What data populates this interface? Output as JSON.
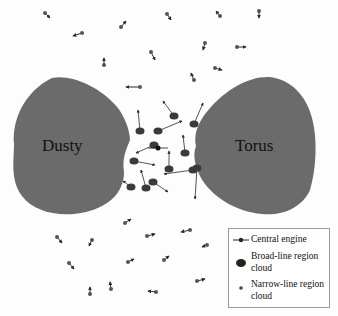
{
  "diagram": {
    "title": "",
    "labels": {
      "left_blob": "Dusty",
      "right_blob": "Torus"
    },
    "colors": {
      "torus": "#6b6b6b",
      "cloud": "#3a3a3a",
      "background": "#ffffff"
    },
    "legend": {
      "items": [
        {
          "symbol": "central-engine",
          "label": "Central engine"
        },
        {
          "symbol": "broad-line-cloud",
          "label": "Broad-line region",
          "label2": "cloud"
        },
        {
          "symbol": "narrow-line-cloud",
          "label": "Narrow-line region",
          "label2": "cloud"
        }
      ]
    },
    "central_engine": {
      "x": 158,
      "y": 148
    },
    "broad_line_clouds": [
      {
        "x": 140,
        "y": 131,
        "ax": 138,
        "ay": 110
      },
      {
        "x": 158,
        "y": 131,
        "ax": 182,
        "ay": 121
      },
      {
        "x": 174,
        "y": 116,
        "ax": 163,
        "ay": 101
      },
      {
        "x": 194,
        "y": 124,
        "ax": 203,
        "ay": 103
      },
      {
        "x": 154,
        "y": 145,
        "ax": 136,
        "ay": 153
      },
      {
        "x": 185,
        "y": 153,
        "ax": 183,
        "ay": 135
      },
      {
        "x": 134,
        "y": 161,
        "ax": 155,
        "ay": 165
      },
      {
        "x": 169,
        "y": 169,
        "ax": 169,
        "ay": 151
      },
      {
        "x": 193,
        "y": 170,
        "ax": 164,
        "ay": 174
      },
      {
        "x": 197,
        "y": 168,
        "ax": 195,
        "ay": 199
      },
      {
        "x": 153,
        "y": 182,
        "ax": 168,
        "ay": 192
      },
      {
        "x": 131,
        "y": 187,
        "ax": 123,
        "ay": 181
      },
      {
        "x": 146,
        "y": 188,
        "ax": 141,
        "ay": 170
      }
    ],
    "narrow_line_clouds": [
      {
        "x": 45,
        "y": 13,
        "ax": 50,
        "ay": 18
      },
      {
        "x": 82,
        "y": 33,
        "ax": 73,
        "ay": 36
      },
      {
        "x": 121,
        "y": 27,
        "ax": 126,
        "ay": 21
      },
      {
        "x": 167,
        "y": 14,
        "ax": 171,
        "ay": 20
      },
      {
        "x": 220,
        "y": 16,
        "ax": 216,
        "ay": 11
      },
      {
        "x": 259,
        "y": 11,
        "ax": 259,
        "ay": 18
      },
      {
        "x": 104,
        "y": 65,
        "ax": 104,
        "ay": 58
      },
      {
        "x": 151,
        "y": 52,
        "ax": 155,
        "ay": 60
      },
      {
        "x": 205,
        "y": 43,
        "ax": 203,
        "ay": 50
      },
      {
        "x": 237,
        "y": 47,
        "ax": 246,
        "ay": 47
      },
      {
        "x": 194,
        "y": 80,
        "ax": 191,
        "ay": 73
      },
      {
        "x": 215,
        "y": 68,
        "ax": 222,
        "ay": 70
      },
      {
        "x": 140,
        "y": 87,
        "ax": 126,
        "ay": 87
      },
      {
        "x": 125,
        "y": 223,
        "ax": 131,
        "ay": 219
      },
      {
        "x": 57,
        "y": 237,
        "ax": 62,
        "ay": 243
      },
      {
        "x": 92,
        "y": 240,
        "ax": 89,
        "ay": 246
      },
      {
        "x": 147,
        "y": 236,
        "ax": 155,
        "ay": 234
      },
      {
        "x": 190,
        "y": 230,
        "ax": 181,
        "ay": 232
      },
      {
        "x": 207,
        "y": 245,
        "ax": 202,
        "ay": 247
      },
      {
        "x": 69,
        "y": 263,
        "ax": 74,
        "ay": 269
      },
      {
        "x": 128,
        "y": 262,
        "ax": 134,
        "ay": 259
      },
      {
        "x": 164,
        "y": 260,
        "ax": 169,
        "ay": 256
      },
      {
        "x": 90,
        "y": 294,
        "ax": 90,
        "ay": 287
      },
      {
        "x": 111,
        "y": 289,
        "ax": 110,
        "ay": 282
      },
      {
        "x": 156,
        "y": 292,
        "ax": 148,
        "ay": 291
      },
      {
        "x": 197,
        "y": 281,
        "ax": 205,
        "ay": 279
      }
    ]
  }
}
